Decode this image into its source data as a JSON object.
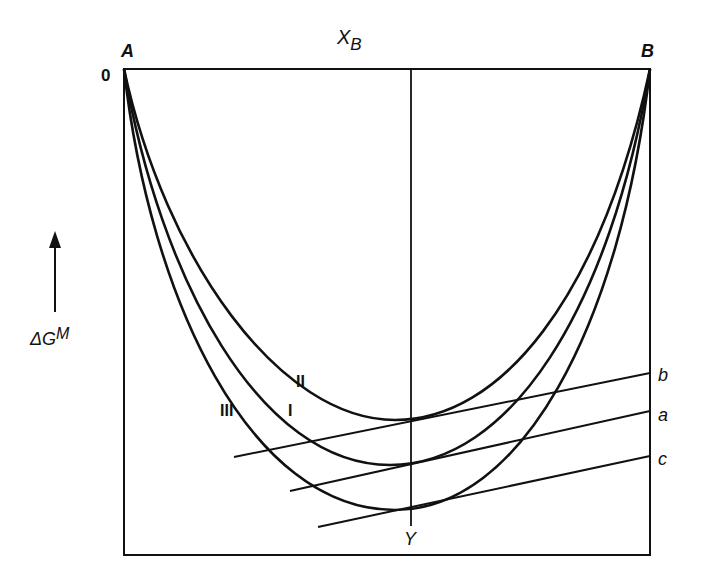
{
  "figure": {
    "type": "free-energy-of-mixing diagram",
    "top_axis_label": "X",
    "top_axis_label_sub": "B",
    "left_axis_label_prefix": "ΔG",
    "left_axis_label_sup": "M",
    "origin_label": "0",
    "corner_left_label": "A",
    "corner_right_label": "B",
    "composition_marker_label": "Y",
    "curves": [
      {
        "id": "II",
        "label": "II"
      },
      {
        "id": "I",
        "label": "I"
      },
      {
        "id": "III",
        "label": "III"
      }
    ],
    "tangent_lines": [
      {
        "id": "b",
        "label": "b",
        "tangent_to": "II"
      },
      {
        "id": "a",
        "label": "a",
        "tangent_to": "I"
      },
      {
        "id": "c",
        "label": "c",
        "tangent_to": "III"
      }
    ],
    "colors": {
      "ink": "#111111",
      "background": "#ffffff"
    }
  }
}
